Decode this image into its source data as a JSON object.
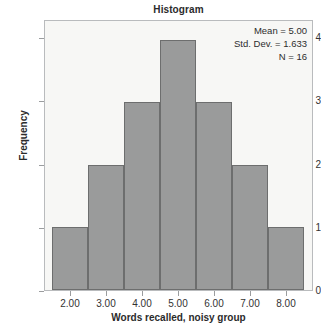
{
  "chart_data": {
    "type": "bar",
    "title": "Histogram",
    "xlabel": "Words recalled, noisy group",
    "ylabel": "Frequency",
    "categories": [
      "2.00",
      "3.00",
      "4.00",
      "5.00",
      "6.00",
      "7.00",
      "8.00"
    ],
    "values": [
      1,
      2,
      3,
      4,
      3,
      2,
      1
    ],
    "x_tick_labels": [
      "2.00",
      "3.00",
      "4.00",
      "5.00",
      "6.00",
      "7.00",
      "8.00"
    ],
    "y_tick_labels": [
      "0",
      "1",
      "2",
      "3",
      "4"
    ],
    "y_tick_values": [
      0,
      1,
      2,
      3,
      4
    ],
    "ylim": [
      0,
      4.3
    ],
    "xlim": [
      1.5,
      8.5
    ],
    "grid": false,
    "legend": null,
    "bin_width": 1,
    "bar_fill_color": "#9a9b9b",
    "bar_edge_color": "#6d6e6e",
    "plot_background_color": "#f7f7f5",
    "plot_border_color": "#b9bbbd",
    "annotations": {
      "position": "top-right-inside",
      "lines": [
        "Mean = 5.00",
        "Std. Dev. = 1.633",
        "N = 16"
      ],
      "mean_label": "Mean = 5.00",
      "std_dev_label": "Std. Dev. = 1.633",
      "n_label": "N = 16"
    }
  }
}
